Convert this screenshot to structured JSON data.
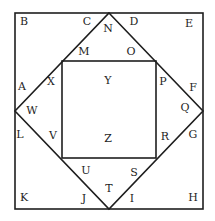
{
  "diagram": {
    "stroke_color": "#1e1e1e",
    "background": "#ffffff",
    "outer_square": {
      "x1": 15,
      "y1": 13,
      "x2": 203,
      "y2": 209
    },
    "diamond": {
      "top": [
        109,
        13
      ],
      "right": [
        203,
        111
      ],
      "bottom": [
        109,
        209
      ],
      "left": [
        15,
        111
      ]
    },
    "inner_square": {
      "x1": 62,
      "y1": 61,
      "x2": 156,
      "y2": 158
    },
    "labels": [
      {
        "text": "B",
        "x": 24,
        "y": 21
      },
      {
        "text": "C",
        "x": 87,
        "y": 21
      },
      {
        "text": "N",
        "x": 108,
        "y": 28
      },
      {
        "text": "D",
        "x": 134,
        "y": 21
      },
      {
        "text": "E",
        "x": 189,
        "y": 23
      },
      {
        "text": "M",
        "x": 84,
        "y": 51
      },
      {
        "text": "O",
        "x": 131,
        "y": 51
      },
      {
        "text": "A",
        "x": 22,
        "y": 86
      },
      {
        "text": "X",
        "x": 51,
        "y": 81
      },
      {
        "text": "Y",
        "x": 108,
        "y": 80
      },
      {
        "text": "P",
        "x": 163,
        "y": 81
      },
      {
        "text": "F",
        "x": 193,
        "y": 87
      },
      {
        "text": "W",
        "x": 32,
        "y": 110
      },
      {
        "text": "Q",
        "x": 185,
        "y": 107
      },
      {
        "text": "L",
        "x": 20,
        "y": 134
      },
      {
        "text": "V",
        "x": 53,
        "y": 135
      },
      {
        "text": "Z",
        "x": 108,
        "y": 138
      },
      {
        "text": "R",
        "x": 165,
        "y": 136
      },
      {
        "text": "G",
        "x": 193,
        "y": 134
      },
      {
        "text": "U",
        "x": 86,
        "y": 170
      },
      {
        "text": "S",
        "x": 134,
        "y": 172
      },
      {
        "text": "T",
        "x": 109,
        "y": 188
      },
      {
        "text": "K",
        "x": 24,
        "y": 197
      },
      {
        "text": "J",
        "x": 84,
        "y": 198
      },
      {
        "text": "I",
        "x": 132,
        "y": 198
      },
      {
        "text": "H",
        "x": 193,
        "y": 197
      }
    ]
  }
}
